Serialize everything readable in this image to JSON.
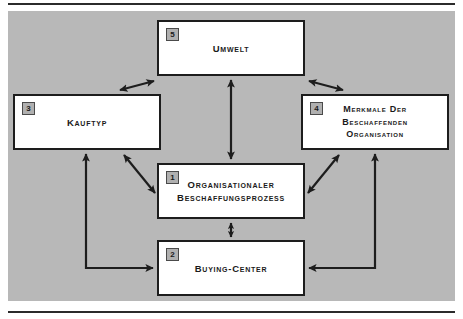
{
  "figure": {
    "type": "block-diagram",
    "background_color": "#b8b8b8",
    "node_fill": "#ffffff",
    "node_border_color": "#1d1d1d",
    "badge_fill": "#b0b0b0",
    "rule_color": "#2b2b2b"
  },
  "nodes": [
    {
      "id": "umwelt",
      "badge": "5",
      "label": "Umwelt",
      "x": 149,
      "y": 9,
      "w": 148,
      "h": 56
    },
    {
      "id": "kauftyp",
      "badge": "3",
      "label": "Kauftyp",
      "x": 5,
      "y": 83,
      "w": 148,
      "h": 56
    },
    {
      "id": "merkmale",
      "badge": "4",
      "label": "Merkmale der\nbeschaffenden\nOrganisation",
      "x": 293,
      "y": 83,
      "w": 148,
      "h": 56
    },
    {
      "id": "prozess",
      "badge": "1",
      "label": "Organisationaler\nBeschaffungsprozess",
      "x": 149,
      "y": 152,
      "w": 148,
      "h": 56
    },
    {
      "id": "buyingcenter",
      "badge": "2",
      "label": "Buying-Center",
      "x": 149,
      "y": 229,
      "w": 148,
      "h": 56
    }
  ],
  "connectors": [
    {
      "id": "umwelt-kauftyp",
      "from": "umwelt",
      "to": "kauftyp",
      "style": "diagonal",
      "heads": "both"
    },
    {
      "id": "umwelt-merkmale",
      "from": "umwelt",
      "to": "merkmale",
      "style": "diagonal",
      "heads": "both"
    },
    {
      "id": "umwelt-prozess",
      "from": "umwelt",
      "to": "prozess",
      "style": "vertical",
      "heads": "both"
    },
    {
      "id": "kauftyp-prozess",
      "from": "kauftyp",
      "to": "prozess",
      "style": "diagonal",
      "heads": "both"
    },
    {
      "id": "merkmale-prozess",
      "from": "merkmale",
      "to": "prozess",
      "style": "diagonal",
      "heads": "both"
    },
    {
      "id": "prozess-buyingcenter",
      "from": "prozess",
      "to": "buyingcenter",
      "style": "vertical",
      "heads": "both"
    },
    {
      "id": "buyingcenter-kauftyp",
      "from": "buyingcenter",
      "to": "kauftyp",
      "style": "elbow-left",
      "heads": "both"
    },
    {
      "id": "merkmale-buyingcenter",
      "from": "merkmale",
      "to": "buyingcenter",
      "style": "elbow-right",
      "heads": "both"
    }
  ]
}
